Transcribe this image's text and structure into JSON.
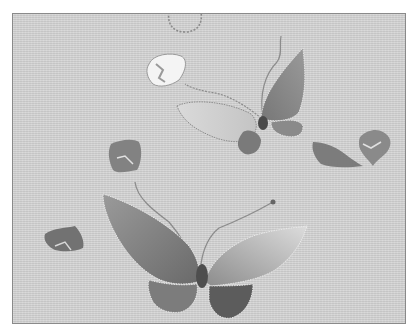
{
  "image": {
    "description": "Grayscale photograph of silk embroidery: two butterflies with scattered petals on a woven fabric ground",
    "colors": {
      "fabric": "#cfcfcf",
      "frame_border": "#8a8a8a",
      "wing_dark": "#6e6e6e",
      "wing_mid": "#8e8e8e",
      "wing_light": "#b8b8b8",
      "wing_pale": "#dedede",
      "petal_white": "#f4f4f4",
      "stitch_outline": "#ececec"
    },
    "elements": [
      {
        "name": "upper-butterfly",
        "position": "upper right center"
      },
      {
        "name": "lower-butterfly",
        "position": "lower center"
      },
      {
        "name": "white-petal",
        "position": "upper center"
      },
      {
        "name": "outline-petal",
        "position": "top edge center"
      },
      {
        "name": "square-petal",
        "position": "left center"
      },
      {
        "name": "leaf-petal",
        "position": "right center"
      },
      {
        "name": "heart-petal",
        "position": "far right"
      },
      {
        "name": "small-petal",
        "position": "lower left"
      }
    ]
  }
}
